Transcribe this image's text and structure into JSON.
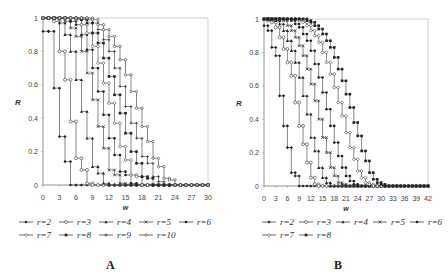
{
  "chart_data": [
    {
      "type": "line",
      "panel_label": "A",
      "title": "",
      "xlabel": "w",
      "ylabel": "R",
      "xlim": [
        0,
        30
      ],
      "ylim": [
        0,
        1
      ],
      "x_ticks": [
        "0",
        "3",
        "6",
        "9",
        "12",
        "15",
        "18",
        "21",
        "24",
        "27",
        "30"
      ],
      "y_ticks": [
        "0",
        "0.2",
        "0.4",
        "0.6",
        "0.8",
        "1"
      ],
      "grid": false,
      "legend_position": "bottom",
      "step": 1,
      "series": [
        {
          "name": "r=2",
          "marker": "filled-diamond",
          "values": [
            0.92,
            0.92,
            0.58,
            0.29,
            0.14,
            0.0,
            0.0,
            0.0,
            0.0,
            0.0,
            0.0,
            0.0,
            0.0,
            0.0,
            0.0,
            0.0,
            0.0,
            0.0,
            0.0,
            0.0,
            0.0,
            0.0,
            0.0,
            0.0,
            0.0,
            0.0,
            0.0,
            0.0,
            0.0,
            0.0,
            0.0
          ]
        },
        {
          "name": "r=3",
          "marker": "open-circle",
          "values": [
            1.0,
            1.0,
            0.98,
            0.8,
            0.63,
            0.38,
            0.16,
            0.09,
            0.01,
            0.0,
            0.0,
            0.0,
            0.0,
            0.0,
            0.0,
            0.0,
            0.0,
            0.0,
            0.0,
            0.0,
            0.0,
            0.0,
            0.0,
            0.0,
            0.0,
            0.0,
            0.0,
            0.0,
            0.0,
            0.0,
            0.0
          ]
        },
        {
          "name": "r=4",
          "marker": "filled-triangle",
          "values": [
            1.0,
            1.0,
            1.0,
            0.97,
            0.9,
            0.8,
            0.63,
            0.44,
            0.28,
            0.11,
            0.07,
            0.01,
            0.0,
            0.0,
            0.0,
            0.0,
            0.0,
            0.0,
            0.0,
            0.0,
            0.0,
            0.0,
            0.0,
            0.0,
            0.0,
            0.0,
            0.0,
            0.0,
            0.0,
            0.0,
            0.0
          ]
        },
        {
          "name": "r=5",
          "marker": "cross",
          "values": [
            1.0,
            1.0,
            1.0,
            1.0,
            0.98,
            0.94,
            0.89,
            0.8,
            0.67,
            0.51,
            0.35,
            0.22,
            0.09,
            0.06,
            0.01,
            0.0,
            0.0,
            0.0,
            0.0,
            0.0,
            0.0,
            0.0,
            0.0,
            0.0,
            0.0,
            0.0,
            0.0,
            0.0,
            0.0,
            0.0,
            0.0
          ]
        },
        {
          "name": "r=6",
          "marker": "filled-circle",
          "values": [
            1.0,
            1.0,
            1.0,
            1.0,
            1.0,
            0.98,
            0.96,
            0.9,
            0.81,
            0.7,
            0.56,
            0.42,
            0.28,
            0.18,
            0.08,
            0.06,
            0.01,
            0.0,
            0.0,
            0.0,
            0.0,
            0.0,
            0.0,
            0.0,
            0.0,
            0.0,
            0.0,
            0.0,
            0.0,
            0.0,
            0.0
          ]
        },
        {
          "name": "r=7",
          "marker": "open-diamond",
          "values": [
            1.0,
            1.0,
            1.0,
            1.0,
            1.0,
            1.0,
            0.99,
            0.96,
            0.91,
            0.83,
            0.73,
            0.61,
            0.49,
            0.37,
            0.23,
            0.15,
            0.06,
            0.05,
            0.0,
            0.0,
            0.0,
            0.0,
            0.0,
            0.0,
            0.0,
            0.0,
            0.0,
            0.0,
            0.0,
            0.0,
            0.0
          ]
        },
        {
          "name": "r=8",
          "marker": "filled-square",
          "values": [
            1.0,
            1.0,
            1.0,
            1.0,
            1.0,
            1.0,
            1.0,
            0.99,
            0.97,
            0.91,
            0.85,
            0.76,
            0.65,
            0.54,
            0.43,
            0.31,
            0.2,
            0.13,
            0.05,
            0.04,
            0.0,
            0.0,
            0.0,
            0.0,
            0.0,
            0.0,
            0.0,
            0.0,
            0.0,
            0.0,
            0.0
          ]
        },
        {
          "name": "r=9",
          "marker": "plus",
          "values": [
            1.0,
            1.0,
            1.0,
            1.0,
            1.0,
            1.0,
            1.0,
            1.0,
            0.99,
            0.97,
            0.93,
            0.87,
            0.8,
            0.7,
            0.59,
            0.47,
            0.37,
            0.28,
            0.17,
            0.13,
            0.05,
            0.02,
            0.0,
            0.0,
            0.0,
            0.0,
            0.0,
            0.0,
            0.0,
            0.0,
            0.0
          ]
        },
        {
          "name": "r=10",
          "marker": "dash-circle",
          "values": [
            1.0,
            1.0,
            1.0,
            1.0,
            1.0,
            1.0,
            1.0,
            1.0,
            1.0,
            0.99,
            0.96,
            0.93,
            0.89,
            0.83,
            0.75,
            0.66,
            0.56,
            0.46,
            0.35,
            0.26,
            0.16,
            0.11,
            0.04,
            0.03,
            0.0,
            0.0,
            0.0,
            0.0,
            0.0,
            0.0,
            0.0
          ]
        }
      ]
    },
    {
      "type": "line",
      "panel_label": "B",
      "title": "",
      "xlabel": "w",
      "ylabel": "R",
      "xlim": [
        0,
        42
      ],
      "ylim": [
        0,
        1
      ],
      "x_ticks": [
        "0",
        "3",
        "6",
        "9",
        "12",
        "15",
        "18",
        "21",
        "24",
        "27",
        "30",
        "33",
        "36",
        "39",
        "42"
      ],
      "y_ticks": [
        "0",
        "0.2",
        "0.4",
        "0.6",
        "0.8",
        "1"
      ],
      "grid": false,
      "legend_position": "bottom",
      "step": 1,
      "series": [
        {
          "name": "r=2",
          "marker": "filled-diamond",
          "values": [
            0.96,
            0.93,
            0.83,
            0.78,
            0.54,
            0.36,
            0.23,
            0.08,
            0.06,
            0.0,
            0.0,
            0.0,
            0.0,
            0.0,
            0.0,
            0.0,
            0.0,
            0.0,
            0.0,
            0.0,
            0.0,
            0.0,
            0.0,
            0.0,
            0.0,
            0.0,
            0.0,
            0.0,
            0.0,
            0.0,
            0.0,
            0.0,
            0.0,
            0.0,
            0.0,
            0.0,
            0.0,
            0.0,
            0.0,
            0.0,
            0.0,
            0.0,
            0.0
          ]
        },
        {
          "name": "r=3",
          "marker": "open-circle",
          "values": [
            1.0,
            0.99,
            0.98,
            0.95,
            0.89,
            0.82,
            0.74,
            0.66,
            0.5,
            0.36,
            0.25,
            0.14,
            0.05,
            0.01,
            0.0,
            0.0,
            0.0,
            0.0,
            0.0,
            0.0,
            0.0,
            0.0,
            0.0,
            0.0,
            0.0,
            0.0,
            0.0,
            0.0,
            0.0,
            0.0,
            0.0,
            0.0,
            0.0,
            0.0,
            0.0,
            0.0,
            0.0,
            0.0,
            0.0,
            0.0,
            0.0,
            0.0,
            0.0
          ]
        },
        {
          "name": "r=4",
          "marker": "filled-triangle",
          "values": [
            1.0,
            1.0,
            1.0,
            0.99,
            0.97,
            0.93,
            0.87,
            0.81,
            0.74,
            0.65,
            0.54,
            0.43,
            0.29,
            0.21,
            0.11,
            0.05,
            0.02,
            0.0,
            0.0,
            0.0,
            0.0,
            0.0,
            0.0,
            0.0,
            0.0,
            0.0,
            0.0,
            0.0,
            0.0,
            0.0,
            0.0,
            0.0,
            0.0,
            0.0,
            0.0,
            0.0,
            0.0,
            0.0,
            0.0,
            0.0,
            0.0,
            0.0,
            0.0
          ]
        },
        {
          "name": "r=5",
          "marker": "cross",
          "values": [
            1.0,
            1.0,
            1.0,
            1.0,
            1.0,
            0.99,
            0.96,
            0.93,
            0.89,
            0.84,
            0.78,
            0.7,
            0.61,
            0.51,
            0.4,
            0.29,
            0.2,
            0.11,
            0.06,
            0.02,
            0.01,
            0.0,
            0.0,
            0.0,
            0.0,
            0.0,
            0.0,
            0.0,
            0.0,
            0.0,
            0.0,
            0.0,
            0.0,
            0.0,
            0.0,
            0.0,
            0.0,
            0.0,
            0.0,
            0.0,
            0.0,
            0.0,
            0.0
          ]
        },
        {
          "name": "r=6",
          "marker": "filled-circle",
          "values": [
            1.0,
            1.0,
            1.0,
            1.0,
            1.0,
            1.0,
            1.0,
            0.99,
            0.97,
            0.95,
            0.91,
            0.87,
            0.81,
            0.73,
            0.65,
            0.56,
            0.46,
            0.36,
            0.26,
            0.18,
            0.11,
            0.06,
            0.03,
            0.01,
            0.0,
            0.0,
            0.0,
            0.0,
            0.0,
            0.0,
            0.0,
            0.0,
            0.0,
            0.0,
            0.0,
            0.0,
            0.0,
            0.0,
            0.0,
            0.0,
            0.0,
            0.0,
            0.0
          ]
        },
        {
          "name": "r=7",
          "marker": "open-diamond",
          "values": [
            1.0,
            1.0,
            1.0,
            1.0,
            1.0,
            1.0,
            1.0,
            1.0,
            1.0,
            0.99,
            0.98,
            0.96,
            0.93,
            0.9,
            0.86,
            0.8,
            0.74,
            0.67,
            0.59,
            0.5,
            0.42,
            0.32,
            0.23,
            0.16,
            0.09,
            0.05,
            0.02,
            0.01,
            0.0,
            0.0,
            0.0,
            0.0,
            0.0,
            0.0,
            0.0,
            0.0,
            0.0,
            0.0,
            0.0,
            0.0,
            0.0,
            0.0,
            0.0
          ]
        },
        {
          "name": "r=8",
          "marker": "filled-square",
          "values": [
            1.0,
            1.0,
            1.0,
            1.0,
            1.0,
            1.0,
            1.0,
            1.0,
            1.0,
            1.0,
            1.0,
            0.99,
            0.98,
            0.96,
            0.94,
            0.91,
            0.87,
            0.83,
            0.77,
            0.7,
            0.63,
            0.55,
            0.47,
            0.38,
            0.3,
            0.21,
            0.15,
            0.08,
            0.04,
            0.02,
            0.01,
            0.0,
            0.0,
            0.0,
            0.0,
            0.0,
            0.0,
            0.0,
            0.0,
            0.0,
            0.0,
            0.0,
            0.0
          ]
        }
      ]
    }
  ],
  "layout": {
    "panels": [
      {
        "left": 43,
        "top": 18,
        "right": 208,
        "bottom": 185
      },
      {
        "left": 264,
        "top": 19,
        "right": 428,
        "bottom": 186
      }
    ]
  }
}
